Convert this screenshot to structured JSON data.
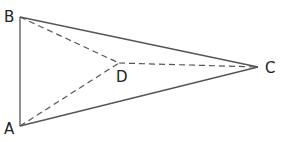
{
  "diagram": {
    "title": "",
    "points": {
      "A": {
        "label": "A",
        "x": 20,
        "y": 126
      },
      "B": {
        "label": "B",
        "x": 20,
        "y": 17
      },
      "C": {
        "label": "C",
        "x": 258,
        "y": 67
      },
      "D": {
        "label": "D",
        "x": 119,
        "y": 63
      }
    },
    "solid_segments": [
      "AB",
      "BC",
      "CA"
    ],
    "dashed_segments": [
      "BD",
      "AD",
      "DC"
    ],
    "colors": {
      "line": "#555555",
      "label": "#222222",
      "background": "#ffffff"
    }
  }
}
